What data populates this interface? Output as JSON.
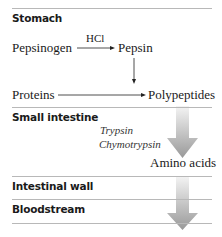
{
  "sections": {
    "stomach": "Stomach",
    "small_intestine": "Small intestine",
    "intestinal_wall": "Intestinal wall",
    "bloodstream": "Bloodstream"
  },
  "stomach": {
    "pepsinogen": "Pepsinogen",
    "hcl": "HCl",
    "pepsin": "Pepsin",
    "proteins": "Proteins",
    "polypeptides": "Polypeptides"
  },
  "small_intestine": {
    "enzyme_1": "Trypsin",
    "enzyme_2": "Chymotrypsin",
    "product": "Amino acids"
  },
  "colors": {
    "divider": "#b8b8b8",
    "text": "#1a1a1a",
    "arrow_gradient_light": "#f2f2f2",
    "arrow_gradient_dark": "#9a9a9a"
  }
}
